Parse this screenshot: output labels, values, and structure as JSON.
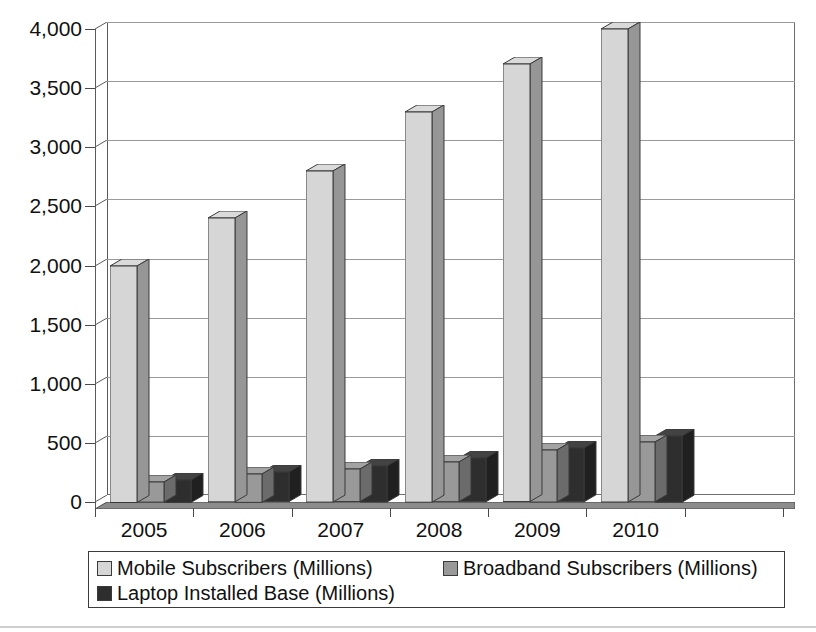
{
  "chart_data": {
    "type": "bar",
    "title": "",
    "subtitle": "",
    "xlabel": "",
    "ylabel": "",
    "categories": [
      "2005",
      "2006",
      "2007",
      "2008",
      "2009",
      "2010",
      ""
    ],
    "series": [
      {
        "name": "Mobile Subscribers (Millions)",
        "color": "#d6d6d6",
        "values": [
          2000,
          2400,
          2800,
          3300,
          3700,
          4000,
          null
        ]
      },
      {
        "name": "Broadband Subscribers (Millions)",
        "color": "#999999",
        "values": [
          170,
          240,
          275,
          335,
          440,
          505,
          null
        ]
      },
      {
        "name": "Laptop Installed Base (Millions)",
        "color": "#2e2e2e",
        "values": [
          190,
          250,
          305,
          370,
          455,
          560,
          null
        ]
      }
    ],
    "ylim": [
      0,
      4000
    ],
    "yticks": [
      0,
      500,
      1000,
      1500,
      2000,
      2500,
      3000,
      3500,
      4000
    ],
    "ytick_labels": [
      "0",
      "500",
      "1,000",
      "1,500",
      "2,000",
      "2,500",
      "3,000",
      "3,500",
      "4,000"
    ],
    "grid": true,
    "grid_axis": "y",
    "legend_position": "bottom",
    "style": "3d-column",
    "empty_trailing_category": true
  },
  "legend": {
    "items": [
      {
        "label": "Mobile Subscribers (Millions)",
        "color": "#d6d6d6"
      },
      {
        "label": "Broadband Subscribers (Millions)",
        "color": "#999999"
      },
      {
        "label": "Laptop Installed Base (Millions)",
        "color": "#2e2e2e"
      }
    ]
  },
  "colors": {
    "series_1": "#d6d6d6",
    "series_2": "#999999",
    "series_3": "#2e2e2e",
    "axis": "#4a4a4a",
    "grid": "#9a9a9a",
    "text": "#111111",
    "background": "#ffffff"
  }
}
